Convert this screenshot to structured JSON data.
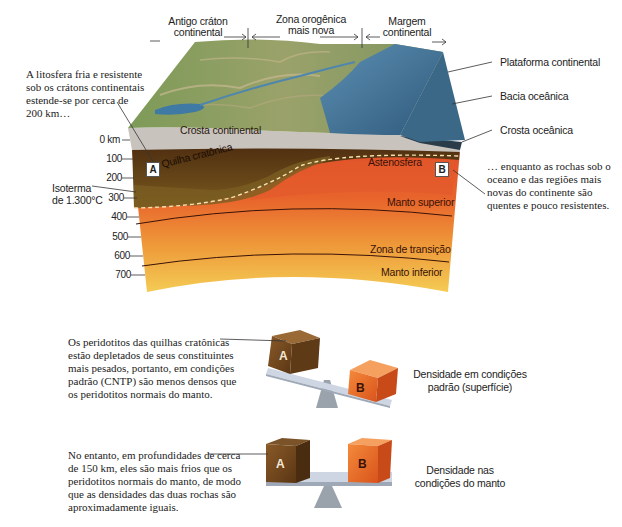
{
  "block_diagram": {
    "regions": [
      {
        "label_line1": "Antigo cráton",
        "label_line2": "continental"
      },
      {
        "label_line1": "Zona orogênica",
        "label_line2": "mais nova"
      },
      {
        "label_line1": "Margem",
        "label_line2": "continental"
      }
    ],
    "left_callout": "A litosfera fria e resistente sob os crátons continentais estende-se por cerca de 200 km…",
    "right_callout": "… enquanto as rochas sob o oceano e das regiões mais novas do continente são quentes e pouco resistentes.",
    "right_labels": {
      "platform": "Plataforma continental",
      "basin": "Bacia oceânica",
      "oceanic_crust": "Crosta oceânica"
    },
    "layer_labels": {
      "continental_crust": "Crosta continental",
      "cratonic_keel": "Quilha cratônica",
      "asthenosphere": "Astenosfera",
      "upper_mantle": "Manto superior",
      "transition_zone": "Zona de transição",
      "lower_mantle": "Manto inferior"
    },
    "isotherm_label_line1": "Isoterma",
    "isotherm_label_line2": "de 1.300°C",
    "markers": {
      "a": "A",
      "b": "B"
    },
    "depth_ticks": [
      "0 km",
      "100",
      "200",
      "300",
      "400",
      "500",
      "600",
      "700"
    ],
    "colors": {
      "crust": "#c9c3bd",
      "keel_dark": "#5a3512",
      "keel_light": "#7a5a1e",
      "asthenosphere": "#e0542a",
      "upper_mantle": "#e8642c",
      "transition": "#ee9a3c",
      "lower_mantle": "#f2c04a",
      "ocean": "#3f6f92",
      "land": "#8a9a5a"
    }
  },
  "density_panels": [
    {
      "description": "Os peridotitos das quilhas cratônicas estão depletados de seus constituintes mais pesados, portanto, em condições padrão (CNTP) são menos densos que os peridotitos normais do manto.",
      "caption_line1": "Densidade em condições",
      "caption_line2": "padrão (superfície)",
      "cube_a": "A",
      "cube_b": "B"
    },
    {
      "description": "No entanto, em profundidades de cerca de 150 km, eles são mais frios que os peridotitos normais do manto, de modo que as densidades das duas rochas são aproximadamente iguais.",
      "caption_line1": "Densidade nas",
      "caption_line2": "condições do manto",
      "cube_a": "A",
      "cube_b": "B"
    }
  ]
}
